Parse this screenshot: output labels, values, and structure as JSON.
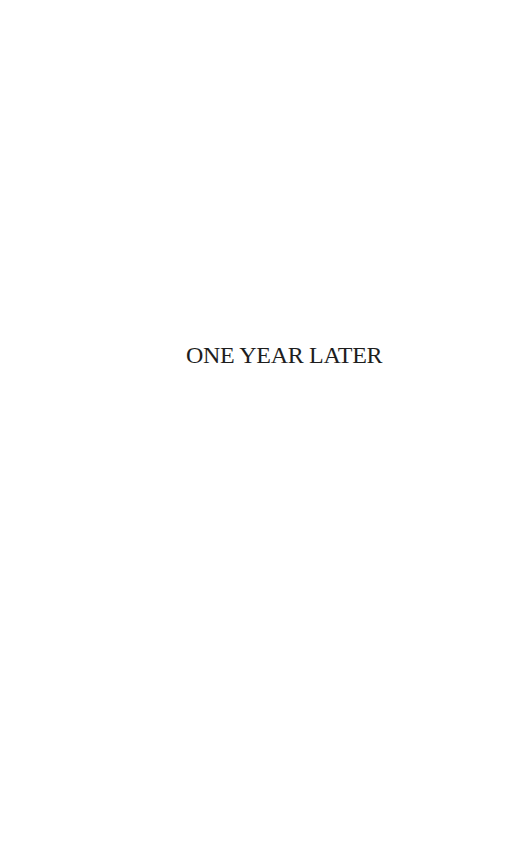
{
  "page": {
    "background_color": "#ffffff",
    "heading": "ONE YEAR LATER",
    "heading_color": "#1e1e1e"
  }
}
